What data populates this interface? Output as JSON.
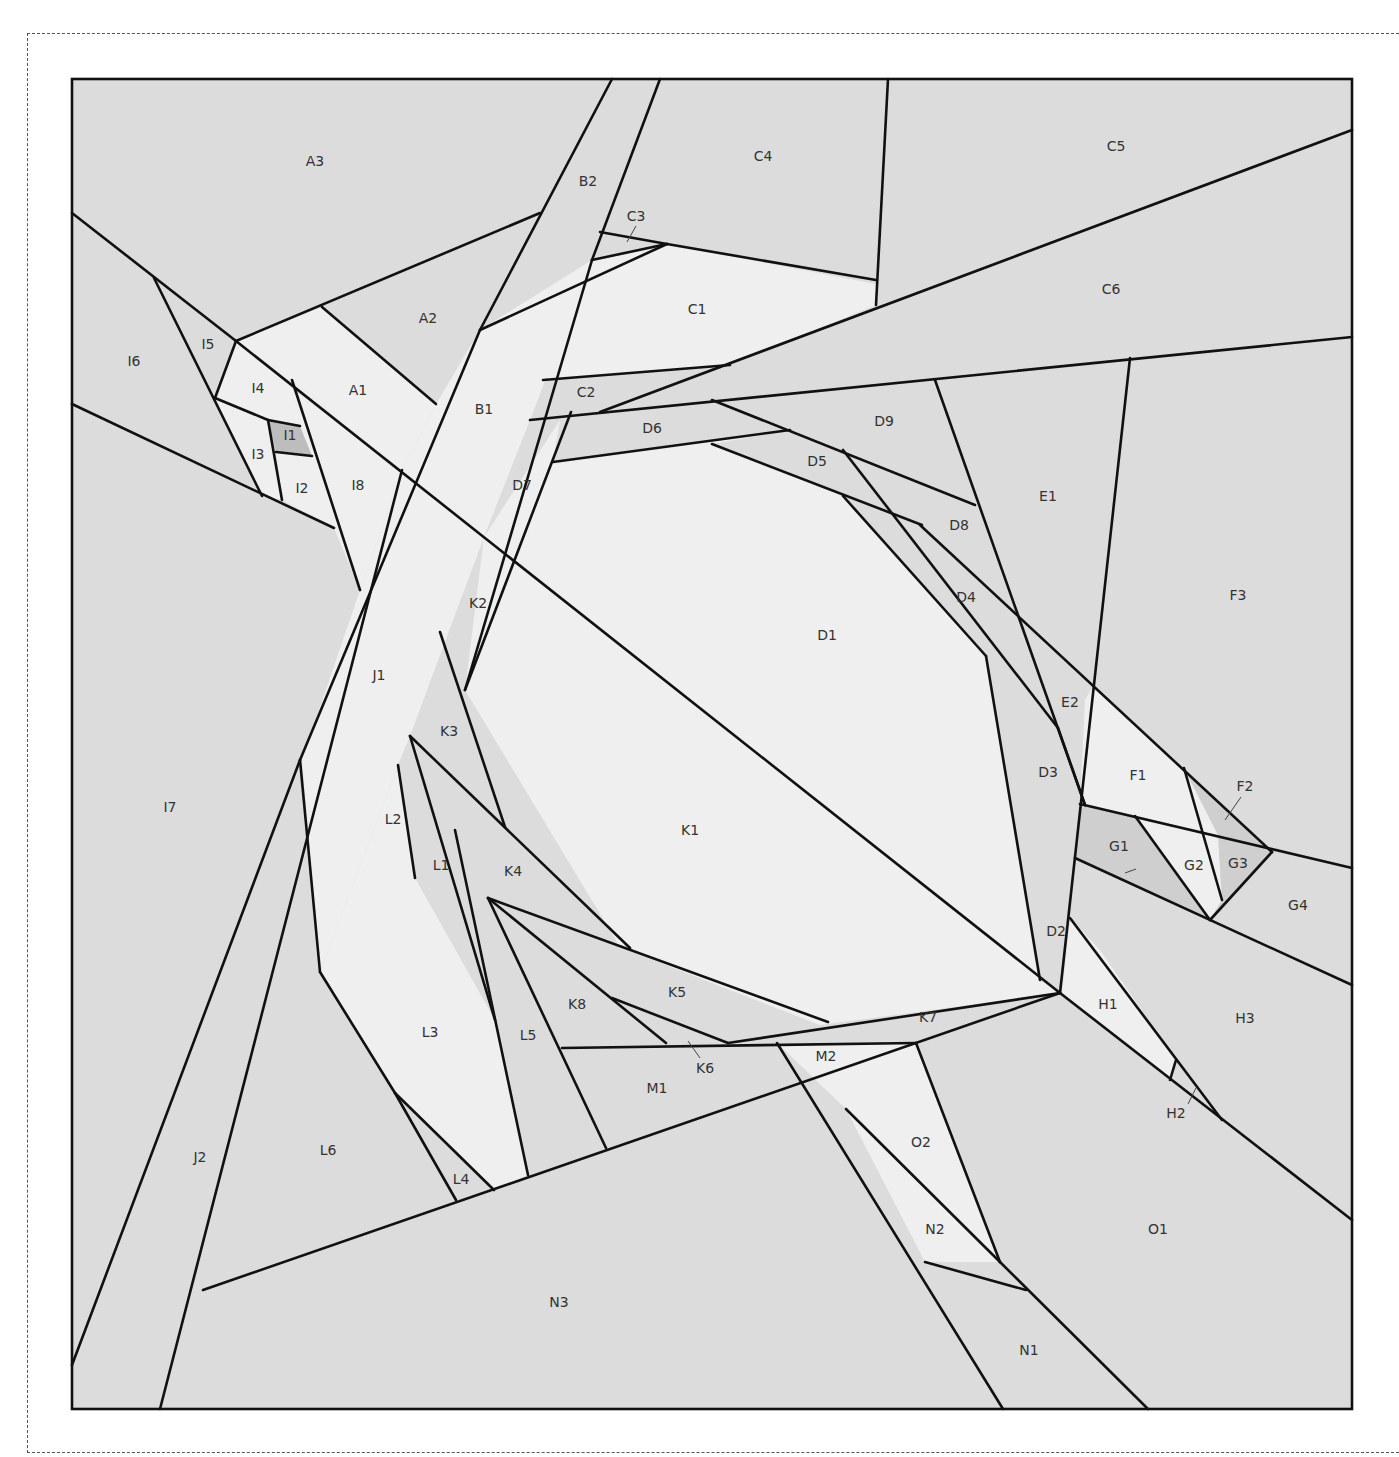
{
  "diagram": {
    "type": "foundation-paper-piecing-pattern",
    "colors": {
      "background": "#dcdcdc",
      "light": "#efefef",
      "mid": "#d2d2d2",
      "dark": "#bdbdbd",
      "line": "#111111",
      "dashed_border": "#555555"
    },
    "labels": [
      {
        "id": "A1",
        "x": 358,
        "y": 391
      },
      {
        "id": "A2",
        "x": 428,
        "y": 319
      },
      {
        "id": "A3",
        "x": 315,
        "y": 162
      },
      {
        "id": "B1",
        "x": 484,
        "y": 410
      },
      {
        "id": "B2",
        "x": 588,
        "y": 182
      },
      {
        "id": "C1",
        "x": 697,
        "y": 310
      },
      {
        "id": "C2",
        "x": 586,
        "y": 393
      },
      {
        "id": "C3",
        "x": 636,
        "y": 217
      },
      {
        "id": "C4",
        "x": 763,
        "y": 157
      },
      {
        "id": "C5",
        "x": 1116,
        "y": 147
      },
      {
        "id": "C6",
        "x": 1111,
        "y": 290
      },
      {
        "id": "D1",
        "x": 827,
        "y": 636
      },
      {
        "id": "D2",
        "x": 1056,
        "y": 932
      },
      {
        "id": "D3",
        "x": 1048,
        "y": 773
      },
      {
        "id": "D4",
        "x": 966,
        "y": 598
      },
      {
        "id": "D5",
        "x": 817,
        "y": 462
      },
      {
        "id": "D6",
        "x": 652,
        "y": 429
      },
      {
        "id": "D7",
        "x": 522,
        "y": 486
      },
      {
        "id": "D8",
        "x": 959,
        "y": 526
      },
      {
        "id": "D9",
        "x": 884,
        "y": 422
      },
      {
        "id": "E1",
        "x": 1048,
        "y": 497
      },
      {
        "id": "E2",
        "x": 1070,
        "y": 703
      },
      {
        "id": "F1",
        "x": 1138,
        "y": 776
      },
      {
        "id": "F2",
        "x": 1245,
        "y": 787
      },
      {
        "id": "F3",
        "x": 1238,
        "y": 596
      },
      {
        "id": "G1",
        "x": 1119,
        "y": 847
      },
      {
        "id": "G2",
        "x": 1194,
        "y": 866
      },
      {
        "id": "G3",
        "x": 1238,
        "y": 864
      },
      {
        "id": "G4",
        "x": 1298,
        "y": 906
      },
      {
        "id": "H1",
        "x": 1108,
        "y": 1005
      },
      {
        "id": "H2",
        "x": 1176,
        "y": 1114
      },
      {
        "id": "H3",
        "x": 1245,
        "y": 1019
      },
      {
        "id": "I1",
        "x": 290,
        "y": 436
      },
      {
        "id": "I2",
        "x": 302,
        "y": 489
      },
      {
        "id": "I3",
        "x": 258,
        "y": 455
      },
      {
        "id": "I4",
        "x": 258,
        "y": 389
      },
      {
        "id": "I5",
        "x": 208,
        "y": 345
      },
      {
        "id": "I6",
        "x": 134,
        "y": 362
      },
      {
        "id": "I7",
        "x": 170,
        "y": 808
      },
      {
        "id": "I8",
        "x": 358,
        "y": 486
      },
      {
        "id": "J1",
        "x": 379,
        "y": 676
      },
      {
        "id": "J2",
        "x": 200,
        "y": 1158
      },
      {
        "id": "K1",
        "x": 690,
        "y": 831
      },
      {
        "id": "K2",
        "x": 478,
        "y": 604
      },
      {
        "id": "K3",
        "x": 449,
        "y": 732
      },
      {
        "id": "K4",
        "x": 513,
        "y": 872
      },
      {
        "id": "K5",
        "x": 677,
        "y": 993
      },
      {
        "id": "K6",
        "x": 705,
        "y": 1069
      },
      {
        "id": "K7",
        "x": 928,
        "y": 1018
      },
      {
        "id": "K8",
        "x": 577,
        "y": 1005
      },
      {
        "id": "L1",
        "x": 441,
        "y": 866
      },
      {
        "id": "L2",
        "x": 393,
        "y": 820
      },
      {
        "id": "L3",
        "x": 430,
        "y": 1033
      },
      {
        "id": "L4",
        "x": 461,
        "y": 1180
      },
      {
        "id": "L5",
        "x": 528,
        "y": 1036
      },
      {
        "id": "L6",
        "x": 328,
        "y": 1151
      },
      {
        "id": "M1",
        "x": 657,
        "y": 1089
      },
      {
        "id": "M2",
        "x": 826,
        "y": 1057
      },
      {
        "id": "N1",
        "x": 1029,
        "y": 1351
      },
      {
        "id": "N2",
        "x": 935,
        "y": 1230
      },
      {
        "id": "N3",
        "x": 559,
        "y": 1303
      },
      {
        "id": "O1",
        "x": 1158,
        "y": 1230
      },
      {
        "id": "O2",
        "x": 921,
        "y": 1143
      }
    ]
  }
}
